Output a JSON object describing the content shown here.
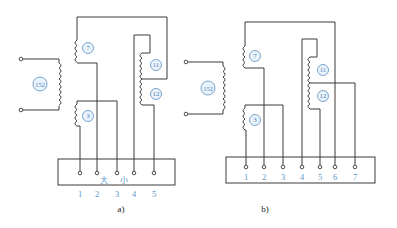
{
  "figure": {
    "colors": {
      "wire": "#3a3a3a",
      "label": "#4a86c0",
      "badge_fill": "#eaf3fb",
      "caption": "#222222"
    },
    "panels": [
      {
        "id": "a",
        "caption": "a)",
        "transformer_label": "152",
        "coil_labels": [
          "7",
          "3",
          "11",
          "12"
        ],
        "terminals": [
          "1",
          "2",
          "3",
          "4",
          "5"
        ],
        "switch_labels": {
          "large": "大",
          "small": "小"
        }
      },
      {
        "id": "b",
        "caption": "b)",
        "transformer_label": "152",
        "coil_labels": [
          "7",
          "3",
          "11",
          "12"
        ],
        "terminals": [
          "1",
          "2",
          "3",
          "4",
          "5",
          "6",
          "7"
        ]
      }
    ]
  }
}
